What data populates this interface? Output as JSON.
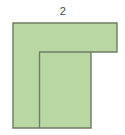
{
  "figure": {
    "canvas": {
      "width": 125,
      "height": 135,
      "background": "#ffffff"
    },
    "title_label": "2",
    "label_position": {
      "x": 63,
      "y": 11
    },
    "colors": {
      "fill": "#b9d7a3",
      "stroke": "#6e7d63",
      "label_text": "#4a4a4a",
      "background": "#ffffff"
    },
    "stroke_width": 1.4,
    "shape": {
      "name": "L-shaped-polygon",
      "points": "13,23 117,23 117,52 91,52 91,128 13,128",
      "description": "L-shaped (rotated gamma) polygon"
    },
    "internal_lines": [
      {
        "name": "inner-vertical-divider",
        "x1": 39.5,
        "y1": 52,
        "x2": 39.5,
        "y2": 128
      },
      {
        "name": "inner-horizontal-divider",
        "x1": 39.5,
        "y1": 52,
        "x2": 91,
        "y2": 52
      }
    ]
  }
}
